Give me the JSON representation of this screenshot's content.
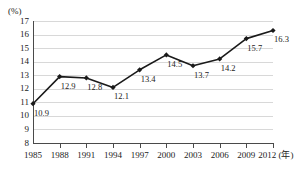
{
  "chart_data": {
    "type": "line",
    "title": "",
    "subtitle": "",
    "xlabel": "年",
    "ylabel": "",
    "unit_label": "(%)",
    "x_axis_suffix": "(年)",
    "categories": [
      "1985",
      "1988",
      "1991",
      "1994",
      "1997",
      "2000",
      "2003",
      "2006",
      "2009",
      "2012"
    ],
    "values": [
      10.9,
      12.9,
      12.8,
      12.1,
      13.4,
      14.5,
      13.7,
      14.2,
      15.7,
      16.3
    ],
    "point_labels": [
      "10.9",
      "12.9",
      "12.8",
      "12.1",
      "13.4",
      "14.5",
      "13.7",
      "14.2",
      "15.7",
      "16.3"
    ],
    "ylim": [
      8,
      17
    ],
    "y_ticks": [
      17,
      16,
      15,
      14,
      13,
      12,
      11,
      10,
      9,
      8
    ],
    "y_tick_labels": [
      "17",
      "16",
      "15",
      "14",
      "13",
      "12",
      "11",
      "10",
      "9",
      "8"
    ],
    "grid": true,
    "legend": null,
    "marker": "diamond",
    "series_color": "#1a1a1a",
    "grid_color": "#d8d8d8",
    "axis_color": "#4a4a4a"
  },
  "axis": {
    "unit": "(%)",
    "x_unit": "(年)"
  }
}
